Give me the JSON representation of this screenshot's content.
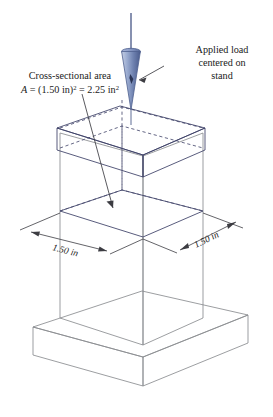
{
  "figure": {
    "background_color": "#ffffff",
    "annotations": {
      "applied_load": {
        "line1": "Applied load",
        "line2": "centered on",
        "line3": "stand"
      },
      "cross_section": {
        "line1": "Cross-sectional area",
        "formula_prefix": "A",
        "formula_eq1": " = (1.50 in)",
        "formula_sup1": "2",
        "formula_eq2": " = 2.25 in",
        "formula_sup2": "2"
      }
    },
    "dimensions": {
      "left_label": "1.50 in",
      "right_label": "1.50 in"
    },
    "values": {
      "side_length": "1.50 in",
      "area": "2.25 in",
      "area_exponent": "2",
      "side_exponent": "2"
    },
    "colors": {
      "plate_dark": "#3b4a8c",
      "plate_mid": "#8e9ccb",
      "plate_light": "#ffffff",
      "edge_gray": "#8a8d90",
      "edge_dark": "#3b3f66",
      "load_blue": "#8fa1c8",
      "load_blue_dark": "#4e5f8e",
      "text": "#1a1a1a",
      "leader": "#3c3c42"
    },
    "icons": {
      "load_arrow": "cone-arrow-down-icon",
      "leader_arrow": "leader-arrow-icon",
      "dimension_arrow": "dimension-arrow-icon"
    }
  }
}
